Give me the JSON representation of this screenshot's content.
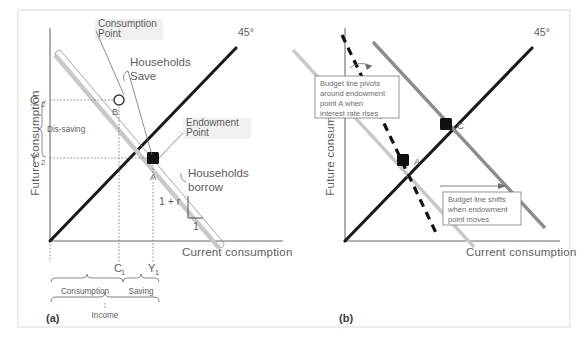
{
  "figure": {
    "panels": [
      {
        "id": "a",
        "label": "(a)",
        "axes": {
          "y_label": "Future consumption",
          "x_label": "Current consumption"
        },
        "ticks": {
          "y": [
            {
              "base": "C",
              "sub": "2"
            },
            {
              "base": "Y",
              "sub": "2"
            }
          ],
          "x": [
            {
              "base": "C",
              "sub": "1"
            },
            {
              "base": "Y",
              "sub": "1"
            }
          ]
        },
        "line_labels": {
          "forty_five": "45°"
        },
        "points": [
          {
            "name": "B",
            "label": "B",
            "style": "open-circle"
          },
          {
            "name": "A",
            "label": "A",
            "style": "filled-square"
          }
        ],
        "annotations": [
          {
            "name": "consumption-point",
            "lines": [
              "Consumption",
              "Point"
            ]
          },
          {
            "name": "endowment-point",
            "lines": [
              "Endowment",
              "Point"
            ]
          },
          {
            "name": "households-save",
            "lines": [
              "Households",
              "Save"
            ]
          },
          {
            "name": "households-borrow",
            "lines": [
              "Households",
              "borrow"
            ]
          }
        ],
        "slope": {
          "rise_label": "1 + r",
          "run_label": "1"
        },
        "braces": [
          {
            "name": "dis-saving",
            "label": "Dis-saving",
            "orientation": "vertical"
          },
          {
            "name": "consumption",
            "label": "Consumption",
            "orientation": "horizontal"
          },
          {
            "name": "saving",
            "label": "Saving",
            "orientation": "horizontal"
          },
          {
            "name": "income",
            "label": "Income",
            "orientation": "horizontal"
          }
        ]
      },
      {
        "id": "b",
        "label": "(b)",
        "axes": {
          "y_label": "Future consumption",
          "x_label": "Current consumption"
        },
        "line_labels": {
          "forty_five": "45°"
        },
        "points": [
          {
            "name": "A",
            "label": "A",
            "style": "filled-square"
          },
          {
            "name": "C",
            "label": "C",
            "style": "filled-square"
          }
        ],
        "callouts": [
          {
            "name": "pivot-callout",
            "lines": [
              "Budget line pivots",
              "around endowment",
              "point A when",
              "interest rate rises"
            ]
          },
          {
            "name": "shift-callout",
            "lines": [
              "Budget line shifts",
              "when endowment",
              "point moves"
            ]
          }
        ]
      }
    ],
    "colors": {
      "line_black": "#1a1a1a",
      "budget_gray": "#c9c9c9",
      "budget_gray_dark": "#8d8d8d",
      "axis_gray": "#9a9a9a",
      "text_gray": "#5d5d60",
      "frame_gray": "#d6d6d6",
      "background": "#ffffff"
    }
  }
}
